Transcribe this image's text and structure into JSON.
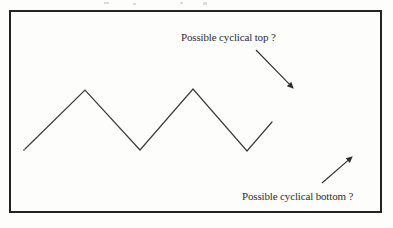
{
  "figure": {
    "background_color": "#fdfdfc",
    "ink_color": "#2e2e2e",
    "frame": {
      "color": "#232323",
      "stroke_width": 2,
      "x": 9,
      "y": 10,
      "width": 373,
      "height": 203
    }
  },
  "annotations": {
    "top": {
      "text": "Possible cyclical top ?",
      "arrow_from": [
        256,
        50
      ],
      "arrow_to": [
        293,
        88
      ],
      "direction": "down-right"
    },
    "bottom": {
      "text": "Possible cyclical bottom ?",
      "arrow_from": [
        322,
        183
      ],
      "arrow_to": [
        352,
        157
      ],
      "direction": "up-right"
    }
  },
  "chart_data": {
    "type": "line",
    "title": "",
    "xlabel": "",
    "ylabel": "",
    "grid": false,
    "legend": "none",
    "series": [
      {
        "name": "price-cycle",
        "points": [
          [
            25,
            149
          ],
          [
            85,
            90
          ],
          [
            140,
            150
          ],
          [
            193,
            89
          ],
          [
            247,
            151
          ],
          [
            272,
            122
          ]
        ],
        "labels": [
          "start",
          "peak-1",
          "trough-1",
          "peak-2",
          "trough-2",
          "end"
        ],
        "color": "#3c3c3c",
        "stroke_width": 1
      }
    ],
    "annotations": [
      "Possible cyclical top ?",
      "Possible cyclical bottom ?"
    ],
    "xlim": [
      9,
      382
    ],
    "ylim": [
      213,
      10
    ]
  }
}
